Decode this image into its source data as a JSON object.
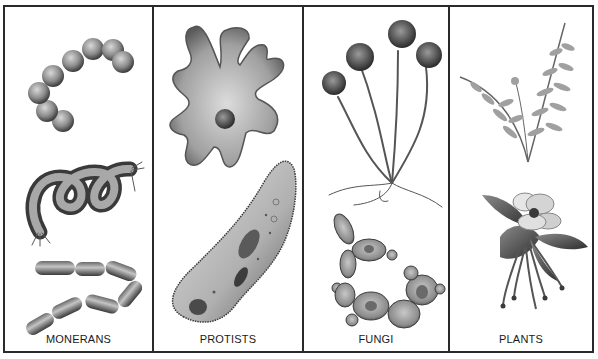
{
  "panels": [
    {
      "label": "MONERANS",
      "illustrations": [
        "chain-of-cocci-bacteria",
        "spiral-spirillum-bacterium",
        "chain-of-bacilli-bacteria"
      ]
    },
    {
      "label": "PROTISTS",
      "illustrations": [
        "amoeba",
        "paramecium"
      ]
    },
    {
      "label": "FUNGI",
      "illustrations": [
        "bread-mold-sporangia",
        "budding-yeast-cells"
      ]
    },
    {
      "label": "PLANTS",
      "illustrations": [
        "fern-fronds",
        "columbine-flower"
      ]
    }
  ],
  "colors": {
    "border": "#2a2a2a",
    "ink": "#1a1a1a",
    "fill_mid": "#8a8a8a",
    "fill_light": "#c8c8c8",
    "fill_dark": "#4a4a4a"
  }
}
